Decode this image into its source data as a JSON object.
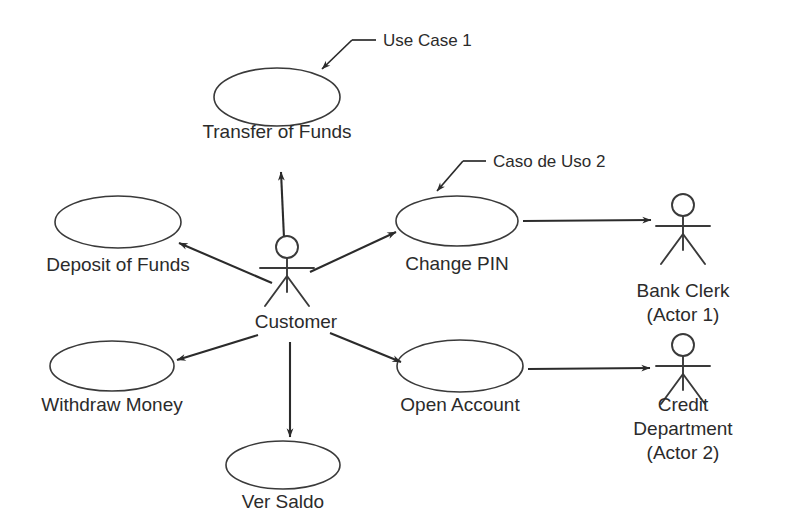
{
  "diagram": {
    "type": "uml-use-case",
    "background_color": "#ffffff",
    "stroke_color": "#3a3a3a",
    "text_color": "#2b2b2b",
    "width": 787,
    "height": 521
  },
  "use_cases": [
    {
      "id": "transfer-of-funds",
      "label": "Transfer of Funds",
      "fill_pattern": "none",
      "cx": 277,
      "cy": 97,
      "rx": 63,
      "ry": 29,
      "label_x": 277,
      "label_y": 138
    },
    {
      "id": "deposit-of-funds",
      "label": "Deposit of Funds",
      "fill_pattern": "none",
      "cx": 118,
      "cy": 222,
      "rx": 63,
      "ry": 26,
      "label_x": 118,
      "label_y": 271
    },
    {
      "id": "change-pin",
      "label": "Change PIN",
      "fill_pattern": "none",
      "cx": 457,
      "cy": 221,
      "rx": 61,
      "ry": 25,
      "label_x": 457,
      "label_y": 270
    },
    {
      "id": "withdraw-money",
      "label": "Withdraw Money",
      "fill_pattern": "diagonal",
      "cx": 112,
      "cy": 366,
      "rx": 62,
      "ry": 25,
      "label_x": 112,
      "label_y": 411
    },
    {
      "id": "open-account",
      "label": "Open Account",
      "fill_pattern": "cross",
      "cx": 460,
      "cy": 366,
      "rx": 63,
      "ry": 26,
      "label_x": 460,
      "label_y": 411
    },
    {
      "id": "ver-saldo",
      "label": "Ver Saldo",
      "fill_pattern": "none",
      "cx": 283,
      "cy": 465,
      "rx": 57,
      "ry": 24,
      "label_x": 283,
      "label_y": 508
    }
  ],
  "actors": [
    {
      "id": "customer",
      "label_lines": [
        "Customer"
      ],
      "x": 287,
      "y": 247,
      "label_x": 296,
      "label_y": 328
    },
    {
      "id": "bank-clerk",
      "label_lines": [
        "Bank Clerk",
        "(Actor 1)"
      ],
      "x": 683,
      "y": 205,
      "label_x": 683,
      "label_y": 297
    },
    {
      "id": "credit-department",
      "label_lines": [
        "Credit",
        "Department",
        "(Actor 2)"
      ],
      "x": 683,
      "y": 345,
      "label_x": 683,
      "label_y": 411
    }
  ],
  "associations": [
    {
      "id": "customer-to-transfer",
      "from": "customer",
      "to": "transfer-of-funds",
      "x1": 284,
      "y1": 238,
      "x2": 281,
      "y2": 172
    },
    {
      "id": "customer-to-deposit",
      "from": "customer",
      "to": "deposit-of-funds",
      "x1": 272,
      "y1": 283,
      "x2": 179,
      "y2": 243
    },
    {
      "id": "customer-to-change-pin",
      "from": "customer",
      "to": "change-pin",
      "x1": 310,
      "y1": 272,
      "x2": 396,
      "y2": 232
    },
    {
      "id": "customer-to-withdraw",
      "from": "customer",
      "to": "withdraw-money",
      "x1": 258,
      "y1": 335,
      "x2": 177,
      "y2": 360
    },
    {
      "id": "customer-to-ver-saldo",
      "from": "customer",
      "to": "ver-saldo",
      "x1": 290,
      "y1": 342,
      "x2": 290,
      "y2": 437
    },
    {
      "id": "customer-to-open-account",
      "from": "customer",
      "to": "open-account",
      "x1": 330,
      "y1": 333,
      "x2": 401,
      "y2": 362
    },
    {
      "id": "change-pin-to-bank-clerk",
      "from": "change-pin",
      "to": "bank-clerk",
      "x1": 523,
      "y1": 221,
      "x2": 651,
      "y2": 220
    },
    {
      "id": "open-account-to-credit",
      "from": "open-account",
      "to": "credit-department",
      "x1": 528,
      "y1": 369,
      "x2": 650,
      "y2": 368
    }
  ],
  "annotations": [
    {
      "id": "use-case-1",
      "label": "Use Case 1",
      "text_x": 383,
      "text_y": 46,
      "leader": {
        "hx1": 376,
        "hy1": 40,
        "hx2": 352,
        "hy2": 40,
        "dx": 322,
        "dy": 69
      }
    },
    {
      "id": "caso-de-uso-2",
      "label": "Caso de Uso 2",
      "text_x": 493,
      "text_y": 167,
      "leader": {
        "hx1": 486,
        "hy1": 161,
        "hx2": 463,
        "hy2": 161,
        "dx": 437,
        "dy": 191
      }
    }
  ]
}
